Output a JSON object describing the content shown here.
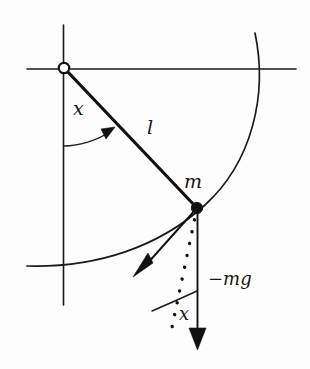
{
  "figure": {
    "type": "physics-diagram",
    "background_color": "#fdfdfd",
    "stroke_color": "#111111",
    "labels": {
      "angle_top": "x",
      "rod_length": "l",
      "mass": "m",
      "gravity_force": "−mg",
      "angle_bottom": "x"
    },
    "elements": {
      "pivot": {
        "name": "pivot-point",
        "x": 64,
        "y": 68,
        "style": "open-circle"
      },
      "bob": {
        "name": "mass-bob",
        "x": 197,
        "y": 208,
        "style": "filled-dot"
      },
      "vertical_axis": {
        "x": 63,
        "y1": 25,
        "y2": 305
      },
      "horizontal_axis": {
        "y": 69,
        "x1": 27,
        "x2": 296
      },
      "swing_arc": {
        "from_x": 255,
        "from_y": 33,
        "to_x": 27,
        "to_y": 266
      },
      "rod": {
        "x1": 64,
        "y1": 68,
        "x2": 197,
        "y2": 208
      },
      "gravity_arrow": {
        "x1": 197,
        "y1": 208,
        "x2": 198,
        "y2": 348
      },
      "tangential_arrow": {
        "x1": 197,
        "y1": 208,
        "x2": 137,
        "y2": 272
      },
      "dotted_arrow": {
        "x1": 197,
        "y1": 208,
        "x2": 172,
        "y2": 345
      },
      "angle_arc_top": {
        "from_x": 63,
        "from_y": 145,
        "to_x": 110,
        "to_y": 130
      },
      "angle_arc_bottom": {
        "from_x": 153,
        "from_y": 310,
        "to_x": 198,
        "to_y": 292
      }
    }
  }
}
